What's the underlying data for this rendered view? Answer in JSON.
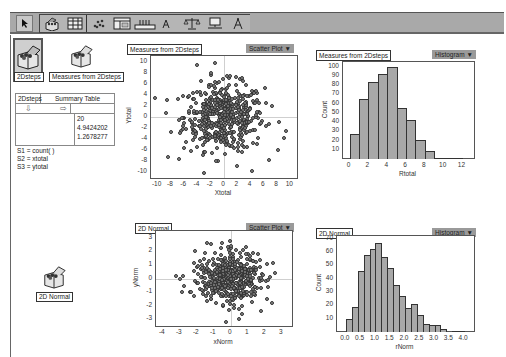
{
  "toolbar": {
    "tools": [
      {
        "name": "arrow-tool",
        "icon": "arrow-pointer-icon"
      },
      {
        "name": "data-box-tool",
        "icon": "box-icon"
      },
      {
        "name": "table-tool",
        "icon": "table-icon"
      },
      {
        "name": "graph-tool",
        "icon": "scatter-icon"
      },
      {
        "name": "summary-table-tool",
        "icon": "summary-table-icon"
      },
      {
        "name": "slider-tool",
        "icon": "slider-icon"
      },
      {
        "name": "text-tool",
        "icon": "text-icon"
      },
      {
        "name": "scales-tool",
        "icon": "scales-icon"
      },
      {
        "name": "web-view-tool",
        "icon": "monitor-icon"
      },
      {
        "name": "tool-shelf-tool",
        "icon": "compass-icon"
      }
    ]
  },
  "collections": [
    {
      "label": "2Dsteps",
      "selected": true
    },
    {
      "label": "Measures from 2Dsteps",
      "selected": false
    },
    {
      "label": "2D Normal",
      "selected": false
    }
  ],
  "summary_table": {
    "collection": "2Dsteps",
    "title": "Summary Table",
    "down_arrow": "⇩",
    "right_arrow": "⇨",
    "values": [
      "20",
      "4.9424202",
      "1.2678277"
    ],
    "formulas": [
      "S1 = count( )",
      "S2 = xtotal",
      "S3 = ytotal"
    ]
  },
  "graphs": [
    {
      "title": "Measures from 2Dsteps",
      "menu": "Scatter Plot ▼"
    },
    {
      "title": "Measures from 2Dsteps",
      "menu": "Histogram ▼"
    },
    {
      "title": "2D Normal",
      "menu": "Scatter Plot ▼"
    },
    {
      "title": "2D Normal",
      "menu": "Histogram ▼"
    }
  ],
  "chart_data": [
    {
      "type": "scatter",
      "title": "Measures from 2Dsteps",
      "xlabel": "Xtotal",
      "ylabel": "Ytotal",
      "xlim": [
        -11,
        11
      ],
      "ylim": [
        -11,
        11
      ],
      "xticks": [
        -10,
        -8,
        -6,
        -4,
        -2,
        0,
        2,
        4,
        6,
        8,
        10
      ],
      "yticks": [
        10,
        8,
        6,
        4,
        2,
        0,
        -2,
        -4,
        -6,
        -8,
        -10
      ],
      "n_points_approx": 500,
      "distribution": "roughly bivariate, centered near (0,0), sd ~3",
      "notable_points": [
        [
          -4,
          9.3
        ],
        [
          -2,
          8
        ],
        [
          0.5,
          7.4
        ],
        [
          -8.5,
          -7.3
        ],
        [
          2,
          -8.8
        ],
        [
          4.2,
          -9.7
        ],
        [
          9.3,
          -2.5
        ],
        [
          9,
          -3.7
        ]
      ]
    },
    {
      "type": "bar",
      "title": "Measures from 2Dsteps",
      "xlabel": "Rtotal",
      "ylabel": "Count",
      "bin_edges": [
        0,
        1,
        2,
        3,
        4,
        5,
        6,
        7,
        8,
        9,
        10,
        11,
        12
      ],
      "values": [
        27,
        65,
        83,
        92,
        100,
        55,
        42,
        21,
        9,
        1,
        1,
        1
      ],
      "xticks": [
        0,
        2,
        4,
        6,
        8,
        10,
        12
      ],
      "yticks": [
        10,
        20,
        30,
        40,
        50,
        60,
        70,
        80,
        90,
        100
      ],
      "ylim": [
        0,
        105
      ]
    },
    {
      "type": "scatter",
      "title": "2D Normal",
      "xlabel": "xNorm",
      "ylabel": "yNorm",
      "xlim": [
        -4.4,
        3.6
      ],
      "ylim": [
        -3.5,
        3.5
      ],
      "xticks": [
        -4,
        -3,
        -2,
        -1,
        0,
        1,
        2,
        3
      ],
      "yticks": [
        3,
        2,
        1,
        0,
        -1,
        -2,
        -3
      ],
      "n_points_approx": 500,
      "distribution": "standard bivariate normal centered at (0,0)",
      "notable_points": [
        [
          -3.2,
          0.2
        ],
        [
          -3,
          0
        ],
        [
          -2.1,
          2
        ],
        [
          2.6,
          0.4
        ],
        [
          0,
          2.4
        ],
        [
          -0.3,
          -3.2
        ],
        [
          0.5,
          -3
        ],
        [
          1.8,
          -2.4
        ]
      ]
    },
    {
      "type": "bar",
      "title": "2D Normal",
      "xlabel": "rNorm",
      "ylabel": "Count",
      "bin_edges": [
        0,
        0.2,
        0.4,
        0.6,
        0.8,
        1.0,
        1.2,
        1.4,
        1.6,
        1.8,
        2.0,
        2.2,
        2.4,
        2.6,
        2.8,
        3.0,
        3.2,
        3.4,
        3.6,
        3.8,
        4.0
      ],
      "values": [
        10,
        19,
        46,
        58,
        62,
        67,
        56,
        48,
        35,
        27,
        18,
        21,
        13,
        6,
        5,
        5,
        2,
        0,
        1,
        1
      ],
      "xticks": [
        0.0,
        0.5,
        1.0,
        1.5,
        2.0,
        2.5,
        3.0,
        3.5,
        4.0
      ],
      "yticks": [
        10,
        20,
        30,
        40,
        50,
        60,
        70
      ],
      "ylim": [
        0,
        72
      ]
    }
  ]
}
